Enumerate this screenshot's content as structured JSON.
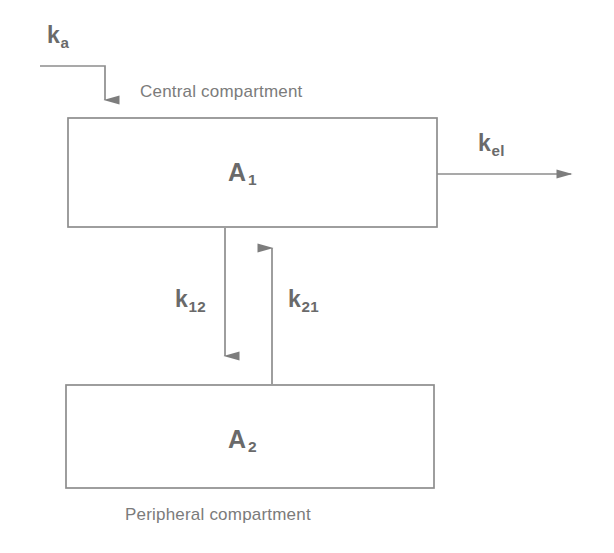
{
  "figure": {
    "background_color": "#ffffff",
    "line_color": "#8a8a8a",
    "text_color": "#6f6f6f"
  },
  "compartments": [
    {
      "id": "central",
      "amount_symbol": "A",
      "amount_subscript": "1",
      "caption": "Central compartment",
      "box": {
        "x": 68,
        "y": 118,
        "width": 369,
        "height": 109
      }
    },
    {
      "id": "peripheral",
      "amount_symbol": "A",
      "amount_subscript": "2",
      "caption": "Peripheral compartment",
      "box": {
        "x": 66,
        "y": 385,
        "width": 368,
        "height": 103
      }
    }
  ],
  "rate_constants": [
    {
      "id": "ka",
      "symbol": "k",
      "subscript": "a",
      "description": "absorption rate constant into central compartment",
      "direction": "into-central"
    },
    {
      "id": "kel",
      "symbol": "k",
      "subscript": "el",
      "description": "elimination rate constant out of central compartment",
      "direction": "out-of-central"
    },
    {
      "id": "k12",
      "symbol": "k",
      "subscript": "12",
      "description": "transfer rate constant central to peripheral",
      "direction": "central-to-peripheral"
    },
    {
      "id": "k21",
      "symbol": "k",
      "subscript": "21",
      "description": "transfer rate constant peripheral to central",
      "direction": "peripheral-to-central"
    }
  ]
}
